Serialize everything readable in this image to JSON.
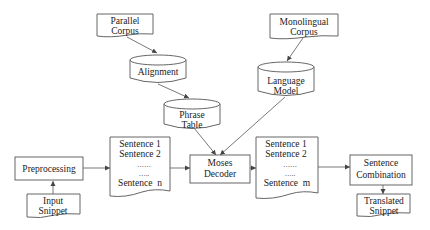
{
  "diagram": {
    "type": "flowchart",
    "title": "",
    "nodes": {
      "parallel_corpus": {
        "lines": [
          "Parallel",
          "Corpus"
        ],
        "shape": "document"
      },
      "alignment": {
        "lines": [
          "Alignment"
        ],
        "shape": "cylinder"
      },
      "phrase_table": {
        "lines": [
          "Phrase",
          "Table"
        ],
        "shape": "cylinder"
      },
      "monolingual_corpus": {
        "lines": [
          "Monolingual",
          "Corpus"
        ],
        "shape": "document"
      },
      "language_model": {
        "lines": [
          "Language",
          "Model"
        ],
        "shape": "cylinder"
      },
      "preprocessing": {
        "lines": [
          "Preprocessing"
        ],
        "shape": "box"
      },
      "input_snippet": {
        "lines": [
          "Input",
          "Snippet"
        ],
        "shape": "document"
      },
      "source_sentences": {
        "lines": [
          "Sentence 1",
          "Sentence 2",
          "……",
          "…..",
          "Sentence  n"
        ],
        "shape": "document"
      },
      "moses_decoder": {
        "lines": [
          "Moses",
          "Decoder"
        ],
        "shape": "box"
      },
      "target_sentences": {
        "lines": [
          "Sentence 1",
          "Sentence 2",
          "……",
          "…..",
          "Sentence  m"
        ],
        "shape": "document"
      },
      "sentence_combination": {
        "lines": [
          "Sentence",
          "Combination"
        ],
        "shape": "box"
      },
      "translated_snippet": {
        "lines": [
          "Translated",
          "Snippet"
        ],
        "shape": "document"
      }
    },
    "edges": [
      {
        "from": "parallel_corpus",
        "to": "alignment"
      },
      {
        "from": "alignment",
        "to": "phrase_table"
      },
      {
        "from": "monolingual_corpus",
        "to": "language_model"
      },
      {
        "from": "phrase_table",
        "to": "moses_decoder"
      },
      {
        "from": "language_model",
        "to": "moses_decoder"
      },
      {
        "from": "input_snippet",
        "to": "preprocessing"
      },
      {
        "from": "preprocessing",
        "to": "source_sentences"
      },
      {
        "from": "source_sentences",
        "to": "moses_decoder"
      },
      {
        "from": "moses_decoder",
        "to": "target_sentences"
      },
      {
        "from": "target_sentences",
        "to": "sentence_combination"
      },
      {
        "from": "sentence_combination",
        "to": "translated_snippet"
      }
    ],
    "colors": {
      "stroke": "#555555",
      "text": "#222222",
      "background": "#ffffff"
    }
  }
}
